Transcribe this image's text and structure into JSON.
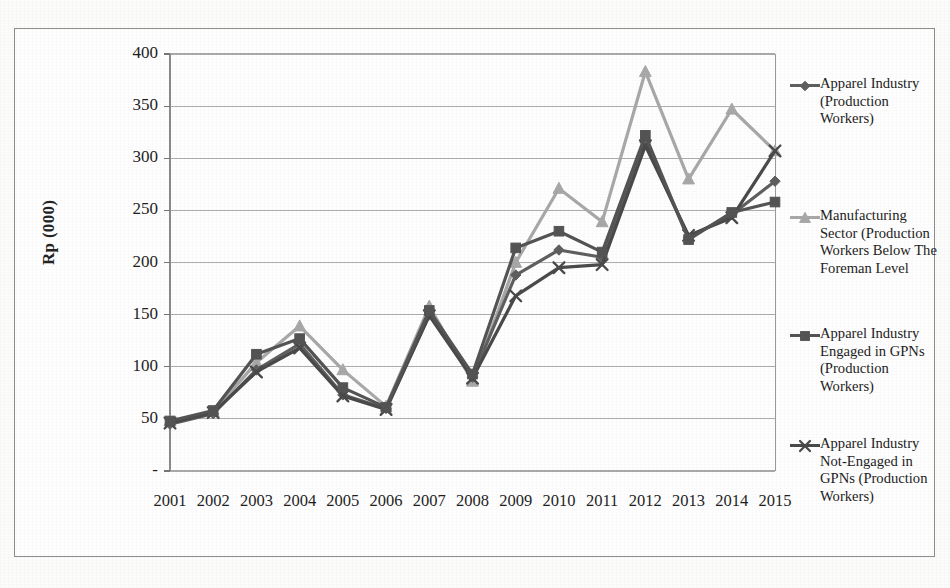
{
  "chart_data": {
    "type": "line",
    "title": "",
    "xlabel": "",
    "ylabel": "Rp (000)",
    "ylim": [
      0,
      400
    ],
    "yticks": [
      "-",
      "50",
      "100",
      "150",
      "200",
      "250",
      "300",
      "350",
      "400"
    ],
    "ytick_values": [
      0,
      50,
      100,
      150,
      200,
      250,
      300,
      350,
      400
    ],
    "grid": true,
    "legend_position": "right",
    "categories": [
      "2001",
      "2002",
      "2003",
      "2004",
      "2005",
      "2006",
      "2007",
      "2008",
      "2009",
      "2010",
      "2011",
      "2012",
      "2013",
      "2014",
      "2015"
    ],
    "series": [
      {
        "name": "Apparel Industry (Production Workers)",
        "marker": "diamond",
        "color": "#5f5f5f",
        "values": [
          45,
          55,
          97,
          122,
          73,
          60,
          150,
          90,
          188,
          212,
          205,
          315,
          224,
          246,
          278
        ]
      },
      {
        "name": "Manufacturing Sector (Production Workers Below The Foreman Level",
        "marker": "triangle",
        "color": "#a8a8a8",
        "values": [
          48,
          57,
          104,
          139,
          97,
          62,
          158,
          86,
          200,
          271,
          239,
          383,
          280,
          347,
          307
        ]
      },
      {
        "name": "Apparel Industry Engaged in GPNs (Production Workers)",
        "marker": "square",
        "color": "#545454",
        "values": [
          48,
          58,
          112,
          127,
          80,
          61,
          154,
          93,
          214,
          230,
          210,
          322,
          222,
          248,
          258
        ]
      },
      {
        "name": "Apparel Industry Not-Engaged in GPNs (Production Workers)",
        "marker": "cross",
        "color": "#4a4a4a",
        "values": [
          46,
          56,
          95,
          118,
          72,
          59,
          149,
          89,
          168,
          195,
          198,
          312,
          226,
          243,
          307
        ]
      }
    ]
  },
  "legend": {
    "items": [
      {
        "label": "Apparel Industry (Production Workers)",
        "marker": "diamond-marker"
      },
      {
        "label": "Manufacturing Sector (Production Workers Below The Foreman Level",
        "marker": "triangle-marker"
      },
      {
        "label": "Apparel Industry Engaged in GPNs (Production Workers)",
        "marker": "square-marker"
      },
      {
        "label": "Apparel Industry Not-Engaged in GPNs (Production Workers)",
        "marker": "cross-marker"
      }
    ]
  },
  "axes": {
    "y_title": "Rp (000)"
  },
  "colors": {
    "series_1": "#5f5f5f",
    "series_2": "#a8a8a8",
    "series_3": "#545454",
    "series_4": "#4a4a4a",
    "grid": "#9b9b9b",
    "frame": "#8d8d8d"
  }
}
